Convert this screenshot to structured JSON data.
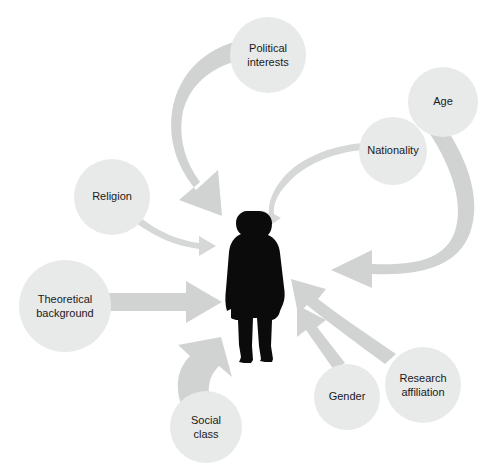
{
  "diagram": {
    "type": "influence-diagram",
    "title": "",
    "center": {
      "name": "researcher-silhouette",
      "label": "",
      "icon": "person-silhouette-icon",
      "x": 252,
      "y": 288
    },
    "colors": {
      "background": "#ffffff",
      "circle_fill": "#e8e9e9",
      "arrow_fill": "#d1d3d3",
      "arrow_fill_thin": "#d6d8d8",
      "silhouette": "#0b0b0b",
      "label_text": "#1a1a1a"
    },
    "nodes": [
      {
        "id": "political-interests",
        "label_lines": [
          "Political",
          "interests"
        ],
        "cx": 268,
        "cy": 55,
        "r": 38,
        "arrow": "thick-curved",
        "direction": "to-center"
      },
      {
        "id": "age",
        "label_lines": [
          "Age"
        ],
        "cx": 443,
        "cy": 102,
        "r": 35,
        "arrow": "thick-curved",
        "direction": "to-center"
      },
      {
        "id": "nationality",
        "label_lines": [
          "Nationality"
        ],
        "cx": 393,
        "cy": 151,
        "r": 34,
        "arrow": "thin-curved",
        "direction": "to-center"
      },
      {
        "id": "religion",
        "label_lines": [
          "Religion"
        ],
        "cx": 112,
        "cy": 197,
        "r": 38,
        "arrow": "thin-curved",
        "direction": "to-center"
      },
      {
        "id": "theoretical-background",
        "label_lines": [
          "Theoretical",
          "background"
        ],
        "cx": 65,
        "cy": 306,
        "r": 46,
        "arrow": "thick-straight",
        "direction": "to-center"
      },
      {
        "id": "social-class",
        "label_lines": [
          "Social",
          "class"
        ],
        "cx": 206,
        "cy": 427,
        "r": 36,
        "arrow": "thick-curved",
        "direction": "to-center"
      },
      {
        "id": "gender",
        "label_lines": [
          "Gender"
        ],
        "cx": 347,
        "cy": 397,
        "r": 33,
        "arrow": "thick-straight",
        "direction": "to-center"
      },
      {
        "id": "research-affiliation",
        "label_lines": [
          "Research",
          "affiliation"
        ],
        "cx": 423,
        "cy": 385,
        "r": 38,
        "arrow": "thick-curved",
        "direction": "to-center"
      }
    ]
  }
}
